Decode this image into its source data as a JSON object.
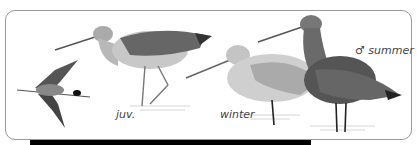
{
  "illustration": {
    "subject": "godwit plumages",
    "labels": {
      "juvenile": "juv.",
      "winter": "winter",
      "summer_male": "♂ summer"
    }
  },
  "colors": {
    "frame_border": "#9a9a9a",
    "bar": "#000000",
    "background": "#ffffff"
  }
}
